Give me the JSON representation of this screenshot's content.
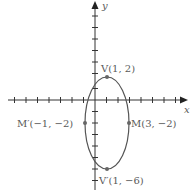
{
  "figure": {
    "type": "ellipse-graph",
    "axes": {
      "x_label": "x",
      "y_label": "y",
      "x_ticks": [
        -8,
        -7,
        -6,
        -5,
        -4,
        -3,
        -2,
        -1,
        1,
        2,
        3,
        4,
        5,
        6,
        7
      ],
      "y_ticks": [
        6,
        5,
        4,
        3,
        2,
        1,
        -1,
        -2,
        -3,
        -4,
        -5,
        -6,
        -7,
        -8
      ]
    },
    "ellipse": {
      "center": [
        1,
        -2
      ],
      "semi_major_vertical": 4,
      "semi_minor_horizontal": 2
    },
    "points": [
      {
        "name": "V",
        "label": "V(1, 2)",
        "x": 1,
        "y": 2
      },
      {
        "name": "V'",
        "label": "V′(1, −6)",
        "x": 1,
        "y": -6
      },
      {
        "name": "M",
        "label": "M(3, −2)",
        "x": 3,
        "y": -2
      },
      {
        "name": "M'",
        "label": "M′(−1, −2)",
        "x": -1,
        "y": -2
      }
    ],
    "colors": {
      "axis": "#333333",
      "curve": "#555555",
      "label": "#5a5a5a"
    }
  }
}
